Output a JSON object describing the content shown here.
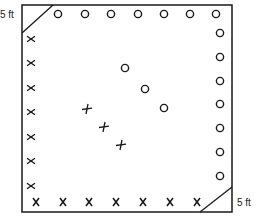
{
  "diagram": {
    "type": "court-layout",
    "corner_labels": {
      "top_left": "5 ft",
      "bottom_right": "5 ft"
    },
    "frame": {
      "x": 22,
      "y": 5,
      "width": 210,
      "height": 207
    },
    "colors": {
      "stroke": "#1a1a1a",
      "background": "#ffffff"
    },
    "markers": {
      "top_row_circles": [
        [
          58,
          14
        ],
        [
          85,
          14
        ],
        [
          111,
          14
        ],
        [
          138,
          14
        ],
        [
          164,
          14
        ],
        [
          190,
          14
        ],
        [
          216,
          14
        ]
      ],
      "right_column_circles": [
        [
          220,
          33
        ],
        [
          220,
          57
        ],
        [
          220,
          81
        ],
        [
          220,
          104
        ],
        [
          220,
          128
        ],
        [
          220,
          152
        ],
        [
          220,
          176
        ]
      ],
      "left_column_x": [
        [
          31,
          39
        ],
        [
          31,
          63
        ],
        [
          31,
          88
        ],
        [
          31,
          112
        ],
        [
          31,
          137
        ],
        [
          31,
          161
        ],
        [
          31,
          186
        ]
      ],
      "bottom_row_x": [
        [
          36,
          202
        ],
        [
          63,
          202
        ],
        [
          89,
          202
        ],
        [
          116,
          202
        ],
        [
          143,
          202
        ],
        [
          170,
          202
        ],
        [
          197,
          202
        ]
      ],
      "center_circles": [
        [
          125,
          68
        ],
        [
          145,
          89
        ],
        [
          164,
          108
        ]
      ],
      "center_plus": [
        [
          87,
          109
        ],
        [
          104,
          127
        ],
        [
          121,
          145
        ]
      ]
    }
  }
}
